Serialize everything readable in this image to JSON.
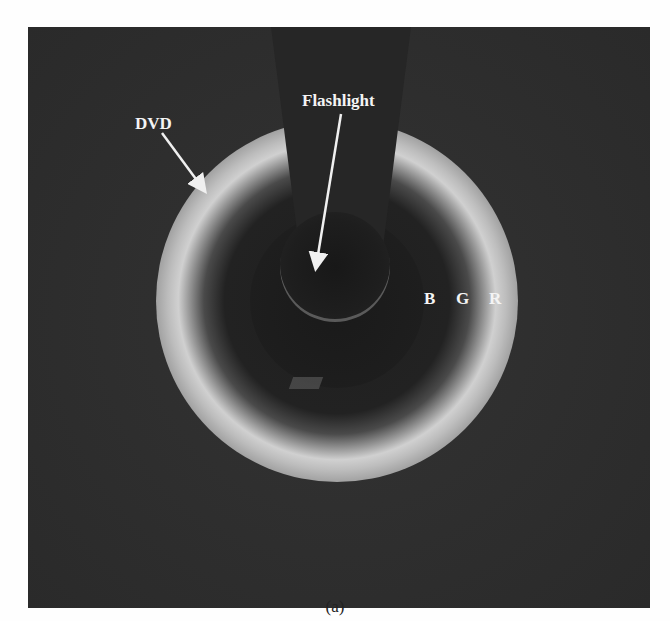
{
  "figure": {
    "caption": "(a)",
    "labels": {
      "dvd": "DVD",
      "flashlight": "Flashlight",
      "bands": [
        "B",
        "G",
        "R"
      ]
    },
    "colors": {
      "background": "#2e2e2e",
      "label_text": "#f4f4f4",
      "ring_bright": "#d0d0d0",
      "page": "#fefefe"
    }
  }
}
